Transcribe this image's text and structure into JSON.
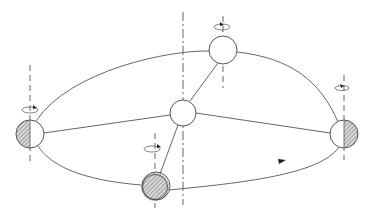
{
  "diagram": {
    "type": "orbit-schematic",
    "colors": {
      "stroke": "#555555",
      "hatch": "#777777",
      "background": "#ffffff"
    },
    "center_body": {
      "cx": 183,
      "cy": 113,
      "r": 13
    },
    "satellites": [
      {
        "id": "left",
        "cx": 30,
        "cy": 134,
        "r": 14,
        "shading": "left-half"
      },
      {
        "id": "top",
        "cx": 223,
        "cy": 50,
        "r": 14,
        "shading": "none"
      },
      {
        "id": "right",
        "cx": 344,
        "cy": 134,
        "r": 14,
        "shading": "right-half"
      },
      {
        "id": "bottom",
        "cx": 155,
        "cy": 187,
        "r": 14,
        "shading": "full"
      }
    ],
    "orbit_direction": "counter-clockwise",
    "labels": []
  }
}
